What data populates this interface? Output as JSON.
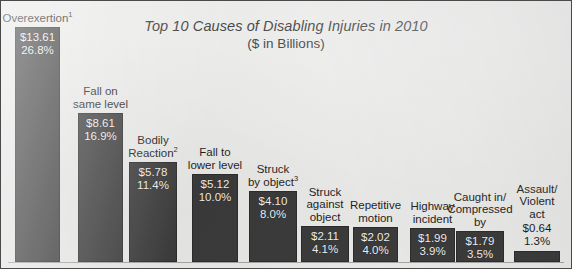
{
  "chart_data": {
    "type": "bar",
    "title": "Top 10 Causes of Disabling Injuries in 2010",
    "subtitle": "($ in Billions)",
    "xlabel": "",
    "ylabel": "",
    "grid": false,
    "legend": "none",
    "ylim": [
      0,
      14.5
    ],
    "categories": [
      "Overexertion",
      "Fall on same level",
      "Bodily Reaction",
      "Fall to lower level",
      "Struck by object",
      "Struck against object",
      "Repetitive motion",
      "Highway incident",
      "Caught in/ Compressed by",
      "Assault/ Violent act"
    ],
    "values": [
      13.61,
      8.61,
      5.78,
      5.12,
      4.1,
      2.11,
      2.02,
      1.99,
      1.79,
      0.64
    ],
    "percents": [
      26.8,
      16.9,
      11.4,
      10.0,
      8.0,
      4.1,
      4.0,
      3.9,
      3.5,
      1.3
    ],
    "bar_color": "#3b3b3b",
    "background_color": "#e9e9e8"
  },
  "bars": [
    {
      "name": "overexertion",
      "label_lines": [
        "Overexertion"
      ],
      "footnote": "1",
      "value_label": "$13.61",
      "percent_label": "26.8%",
      "labels_inside": true
    },
    {
      "name": "fall-on-same-level",
      "label_lines": [
        "Fall on",
        "same level"
      ],
      "footnote": "",
      "value_label": "$8.61",
      "percent_label": "16.9%",
      "labels_inside": true
    },
    {
      "name": "bodily-reaction",
      "label_lines": [
        "Bodily",
        "Reaction"
      ],
      "footnote": "2",
      "value_label": "$5.78",
      "percent_label": "11.4%",
      "labels_inside": true
    },
    {
      "name": "fall-to-lower-level",
      "label_lines": [
        "Fall to",
        "lower level"
      ],
      "footnote": "",
      "value_label": "$5.12",
      "percent_label": "10.0%",
      "labels_inside": true
    },
    {
      "name": "struck-by-object",
      "label_lines": [
        "Struck",
        "by object"
      ],
      "footnote": "3",
      "value_label": "$4.10",
      "percent_label": "8.0%",
      "labels_inside": true
    },
    {
      "name": "struck-against-object",
      "label_lines": [
        "Struck",
        "against",
        "object"
      ],
      "footnote": "",
      "value_label": "$2.11",
      "percent_label": "4.1%",
      "labels_inside": true
    },
    {
      "name": "repetitive-motion",
      "label_lines": [
        "Repetitive",
        "motion"
      ],
      "footnote": "",
      "value_label": "$2.02",
      "percent_label": "4.0%",
      "labels_inside": true
    },
    {
      "name": "highway-incident",
      "label_lines": [
        "Highway",
        "incident"
      ],
      "footnote": "",
      "value_label": "$1.99",
      "percent_label": "3.9%",
      "labels_inside": true
    },
    {
      "name": "caught-in-compressed-by",
      "label_lines": [
        "Caught in/",
        "Compressed",
        "by"
      ],
      "footnote": "",
      "value_label": "$1.79",
      "percent_label": "3.5%",
      "labels_inside": true
    },
    {
      "name": "assault-violent-act",
      "label_lines": [
        "Assault/",
        "Violent",
        "act"
      ],
      "footnote": "",
      "value_label": "$0.64",
      "percent_label": "1.3%",
      "labels_inside": false
    }
  ]
}
